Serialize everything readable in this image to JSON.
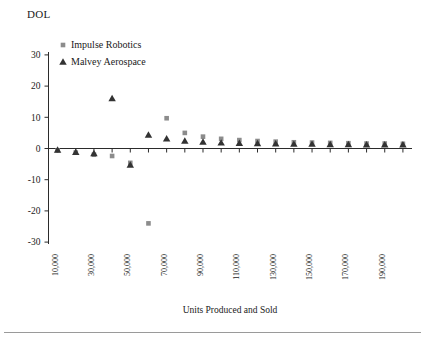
{
  "chart_data": {
    "type": "scatter",
    "title": "",
    "ylabel": "DOL",
    "xlabel": "Units Produced and Sold",
    "ylim": [
      -30,
      30
    ],
    "yticks": [
      30,
      20,
      10,
      0,
      -10,
      -20,
      -30
    ],
    "ytick_labels": [
      "30",
      "20",
      "10",
      "0",
      "-10",
      "-20",
      "-30"
    ],
    "xlim": [
      5000,
      205000
    ],
    "xticks": [
      10000,
      20000,
      30000,
      40000,
      50000,
      60000,
      70000,
      80000,
      90000,
      100000,
      110000,
      120000,
      130000,
      140000,
      150000,
      160000,
      170000,
      180000,
      190000,
      200000
    ],
    "xtick_labels": [
      "10,000",
      "30,000",
      "50,000",
      "70,000",
      "90,000",
      "110,000",
      "130,000",
      "150,000",
      "170,000",
      "190,000"
    ],
    "xtick_labeled_values": [
      10000,
      30000,
      50000,
      70000,
      90000,
      110000,
      130000,
      150000,
      170000,
      190000
    ],
    "grid": false,
    "legend_position": "top-left-inside",
    "x": [
      10000,
      20000,
      30000,
      40000,
      50000,
      60000,
      70000,
      80000,
      90000,
      100000,
      110000,
      120000,
      130000,
      140000,
      150000,
      160000,
      170000,
      180000,
      190000,
      200000
    ],
    "series": [
      {
        "name": "Impulse Robotics",
        "marker": "square",
        "color": "#8c8c8c",
        "values": [
          -0.6,
          -1.3,
          -2.0,
          -2.4,
          -4.6,
          -24.0,
          9.7,
          5.0,
          3.8,
          3.1,
          2.7,
          2.4,
          2.2,
          2.0,
          1.9,
          1.8,
          1.7,
          1.6,
          1.6,
          1.5
        ]
      },
      {
        "name": "Malvey Aerospace",
        "marker": "triangle",
        "color": "#333333",
        "values": [
          -0.5,
          -1.2,
          -1.6,
          16.0,
          -5.3,
          4.3,
          3.1,
          2.4,
          2.1,
          1.8,
          1.7,
          1.6,
          1.5,
          1.4,
          1.4,
          1.3,
          1.3,
          1.2,
          1.2,
          1.2
        ]
      }
    ]
  },
  "legend": {
    "items": [
      {
        "label": "Impulse Robotics",
        "marker": "square"
      },
      {
        "label": "Malvey Aerospace",
        "marker": "triangle"
      }
    ]
  }
}
